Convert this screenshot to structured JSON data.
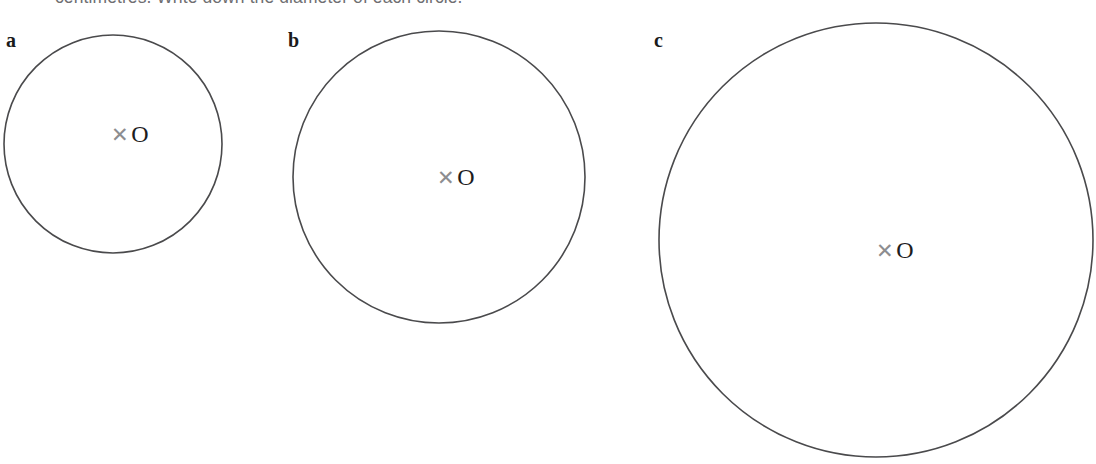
{
  "page": {
    "background": "#ffffff",
    "width": 1096,
    "height": 464,
    "stroke_color": "#4a4a4c",
    "text_color": "#6f6f72",
    "label_color": "#1b1b1b",
    "cross_color": "#8d8d90"
  },
  "instruction": {
    "text": "centimetres. Write down the diameter of each circle."
  },
  "figures": [
    {
      "label": "a",
      "label_x": 6,
      "label_y": 30,
      "cx": 113,
      "cy": 144,
      "r": 109,
      "center_cross": "✕",
      "center_letter": "O",
      "mark_x": 130,
      "mark_y": 134
    },
    {
      "label": "b",
      "label_x": 288,
      "label_y": 30,
      "cx": 439,
      "cy": 177,
      "r": 146,
      "center_cross": "✕",
      "center_letter": "O",
      "mark_x": 456,
      "mark_y": 177
    },
    {
      "label": "c",
      "label_x": 654,
      "label_y": 30,
      "cx": 876,
      "cy": 240,
      "r": 217,
      "center_cross": "✕",
      "center_letter": "O",
      "mark_x": 895,
      "mark_y": 250
    }
  ],
  "chart_data": {
    "type": "diagram",
    "items": [
      {
        "label": "a",
        "radius_px": 109,
        "diameter_px": 218,
        "centre_label": "O"
      },
      {
        "label": "b",
        "radius_px": 146,
        "diameter_px": 292,
        "centre_label": "O"
      },
      {
        "label": "c",
        "radius_px": 217,
        "diameter_px": 434,
        "centre_label": "O"
      }
    ]
  }
}
